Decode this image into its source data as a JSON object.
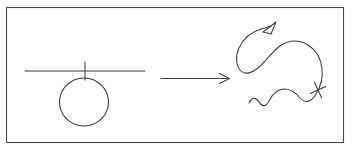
{
  "figure": {
    "description": "A circle suspended from a horizontal line transforms into a squiggly curve with an arrowhead and a cross mark",
    "background_color": "#ffffff",
    "stroke_color": "#3a3a3f",
    "frame_color": "#4a4a4f",
    "canvas": {
      "width": 352,
      "height": 153
    },
    "frame": {
      "x": 6,
      "y": 7,
      "width": 338,
      "height": 136
    },
    "left_symbol": {
      "name": "circle-on-line",
      "horizontal_line": {
        "x1": 25,
        "y1": 71,
        "x2": 145,
        "y2": 71
      },
      "vertical_tick": {
        "x1": 85,
        "y1": 62,
        "x2": 85,
        "y2": 80
      },
      "circle": {
        "cx": 84,
        "cy": 102,
        "rx": 24,
        "ry": 24
      }
    },
    "transform_arrow": {
      "name": "right-arrow",
      "shaft": {
        "x1": 161,
        "y1": 78,
        "x2": 228,
        "y2": 78
      },
      "head_length": 9,
      "head_spread": 5
    },
    "right_symbol": {
      "name": "squiggle-curve",
      "arrow_head": {
        "tip_x": 274,
        "tip_y": 24
      },
      "cross_mark": {
        "cx": 318,
        "cy": 90,
        "size": 7,
        "rotation": 20
      }
    }
  }
}
